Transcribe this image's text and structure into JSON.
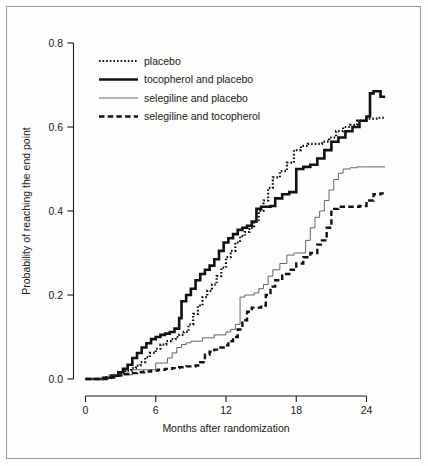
{
  "figure": {
    "background_color": "#fdfdfb",
    "border_color": "#9a9a94",
    "ink_color": "#1a1a1a"
  },
  "chart_data": {
    "type": "line",
    "title": "",
    "subtitle": "",
    "xlabel": "Months after randomization",
    "ylabel": "Probability of reaching the end point",
    "xlim": [
      0,
      26
    ],
    "ylim": [
      0.0,
      0.8
    ],
    "xticks": [
      0,
      6,
      12,
      18,
      24
    ],
    "xtick_labels": [
      "0",
      "6",
      "12",
      "18",
      "24"
    ],
    "yticks": [
      0.0,
      0.2,
      0.4,
      0.6,
      0.8
    ],
    "ytick_labels": [
      "0.0",
      "0.2",
      "0.4",
      "0.6",
      "0.8"
    ],
    "grid": false,
    "legend_position": "upper-left",
    "step_style": "post",
    "series": [
      {
        "name": "placebo",
        "style": "dotted",
        "color": "#111111",
        "width": 2.2,
        "dash": "1.6,2.0",
        "x": [
          0,
          1.6,
          2.4,
          3.0,
          3.4,
          3.9,
          4.3,
          4.7,
          5.1,
          5.5,
          6.0,
          6.4,
          6.9,
          7.3,
          7.7,
          8.0,
          8.4,
          8.8,
          9.2,
          9.6,
          10.0,
          10.4,
          10.8,
          11.2,
          11.6,
          12.0,
          12.4,
          12.8,
          13.2,
          13.6,
          14.0,
          14.4,
          14.8,
          15.2,
          15.6,
          16.0,
          16.6,
          17.2,
          17.8,
          18.4,
          19.0,
          19.6,
          20.2,
          20.8,
          21.4,
          22.0,
          22.6,
          23.2,
          23.8,
          24.4,
          25.0,
          25.6
        ],
        "y": [
          0.0,
          0.004,
          0.01,
          0.014,
          0.02,
          0.026,
          0.032,
          0.04,
          0.052,
          0.062,
          0.072,
          0.082,
          0.09,
          0.095,
          0.1,
          0.105,
          0.112,
          0.13,
          0.155,
          0.175,
          0.195,
          0.21,
          0.225,
          0.245,
          0.265,
          0.29,
          0.305,
          0.325,
          0.34,
          0.35,
          0.36,
          0.375,
          0.4,
          0.425,
          0.455,
          0.48,
          0.495,
          0.515,
          0.545,
          0.555,
          0.56,
          0.56,
          0.565,
          0.575,
          0.59,
          0.6,
          0.605,
          0.615,
          0.62,
          0.62,
          0.622,
          0.622
        ],
        "final_value": 0.622
      },
      {
        "name": "tocopherol and placebo",
        "style": "solid-thick",
        "color": "#111111",
        "width": 2.6,
        "dash": "",
        "x": [
          0,
          1.5,
          2.2,
          2.8,
          3.2,
          3.6,
          4.0,
          4.4,
          4.8,
          5.2,
          5.6,
          6.0,
          6.4,
          6.8,
          7.2,
          7.6,
          8.0,
          8.2,
          8.6,
          9.0,
          9.4,
          9.8,
          10.2,
          10.6,
          11.0,
          11.4,
          11.8,
          12.2,
          12.6,
          13.0,
          13.4,
          13.8,
          14.2,
          14.6,
          15.0,
          15.4,
          15.8,
          16.2,
          16.8,
          17.4,
          18.0,
          18.6,
          19.2,
          19.8,
          20.4,
          21.0,
          21.6,
          22.2,
          22.8,
          23.4,
          24.0,
          24.3,
          24.6,
          25.2,
          25.6
        ],
        "y": [
          0.0,
          0.003,
          0.008,
          0.016,
          0.024,
          0.034,
          0.05,
          0.062,
          0.075,
          0.085,
          0.095,
          0.1,
          0.105,
          0.108,
          0.112,
          0.12,
          0.145,
          0.185,
          0.2,
          0.215,
          0.235,
          0.25,
          0.26,
          0.27,
          0.285,
          0.305,
          0.325,
          0.335,
          0.345,
          0.355,
          0.36,
          0.365,
          0.375,
          0.405,
          0.41,
          0.41,
          0.412,
          0.43,
          0.44,
          0.445,
          0.5,
          0.505,
          0.51,
          0.525,
          0.545,
          0.565,
          0.575,
          0.59,
          0.6,
          0.615,
          0.625,
          0.68,
          0.685,
          0.672,
          0.672
        ],
        "final_value": 0.672
      },
      {
        "name": "selegiline and placebo",
        "style": "solid-thin",
        "color": "#555555",
        "width": 0.9,
        "dash": "",
        "x": [
          0,
          2.0,
          4.0,
          6.0,
          7.0,
          7.4,
          7.8,
          8.2,
          8.6,
          9.0,
          10.0,
          11.0,
          12.0,
          12.4,
          12.8,
          13.2,
          13.6,
          14.0,
          14.4,
          14.8,
          15.2,
          15.6,
          16.0,
          16.6,
          17.2,
          17.8,
          18.4,
          18.8,
          19.2,
          19.6,
          20.0,
          20.4,
          20.8,
          21.2,
          21.6,
          22.0,
          22.6,
          23.2,
          24.0,
          25.0,
          25.6
        ],
        "y": [
          0.0,
          0.01,
          0.022,
          0.038,
          0.05,
          0.062,
          0.075,
          0.082,
          0.086,
          0.09,
          0.098,
          0.105,
          0.112,
          0.118,
          0.13,
          0.195,
          0.2,
          0.2,
          0.205,
          0.215,
          0.225,
          0.245,
          0.26,
          0.275,
          0.295,
          0.3,
          0.3,
          0.33,
          0.36,
          0.385,
          0.4,
          0.425,
          0.45,
          0.475,
          0.49,
          0.5,
          0.503,
          0.505,
          0.505,
          0.505,
          0.505
        ],
        "final_value": 0.505
      },
      {
        "name": "selegiline and tocopherol",
        "style": "dashed",
        "color": "#111111",
        "width": 2.4,
        "dash": "5.5,3.2",
        "x": [
          0,
          1.8,
          2.6,
          3.2,
          3.8,
          4.4,
          5.0,
          5.6,
          6.2,
          6.8,
          7.4,
          8.0,
          8.6,
          9.0,
          9.4,
          9.8,
          10.2,
          10.6,
          11.0,
          11.4,
          11.8,
          12.2,
          12.6,
          13.0,
          13.4,
          13.8,
          14.2,
          14.6,
          15.0,
          15.4,
          15.8,
          16.2,
          16.8,
          17.4,
          18.0,
          18.6,
          19.2,
          19.8,
          20.2,
          20.6,
          21.0,
          21.6,
          22.2,
          22.8,
          23.4,
          24.0,
          24.6,
          25.2,
          25.6
        ],
        "y": [
          0.0,
          0.004,
          0.008,
          0.012,
          0.014,
          0.016,
          0.018,
          0.02,
          0.022,
          0.024,
          0.026,
          0.028,
          0.03,
          0.03,
          0.032,
          0.04,
          0.058,
          0.065,
          0.07,
          0.075,
          0.08,
          0.09,
          0.1,
          0.118,
          0.14,
          0.16,
          0.17,
          0.17,
          0.175,
          0.2,
          0.22,
          0.235,
          0.25,
          0.26,
          0.275,
          0.29,
          0.3,
          0.32,
          0.33,
          0.36,
          0.405,
          0.41,
          0.41,
          0.41,
          0.412,
          0.425,
          0.44,
          0.442,
          0.442
        ],
        "final_value": 0.442
      }
    ]
  },
  "legend": {
    "entries": [
      {
        "label": "placebo",
        "style": "dotted"
      },
      {
        "label": "tocopherol and placebo",
        "style": "solid-thick"
      },
      {
        "label": "selegiline and placebo",
        "style": "solid-thin"
      },
      {
        "label": "selegiline and tocopherol",
        "style": "dashed"
      }
    ]
  }
}
